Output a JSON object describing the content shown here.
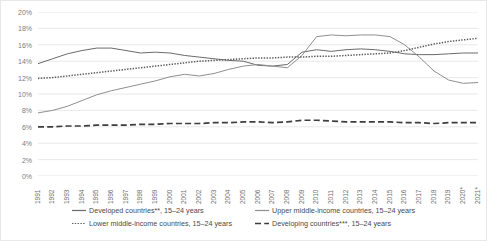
{
  "chart_data": {
    "type": "line",
    "title": "",
    "xlabel": "",
    "ylabel": "",
    "ylim": [
      0,
      20
    ],
    "ytick_step": 2,
    "ytick_labels": [
      "0%",
      "2%",
      "4%",
      "6%",
      "8%",
      "10%",
      "12%",
      "14%",
      "16%",
      "18%",
      "20%"
    ],
    "grid": true,
    "grid_axis": "y",
    "legend_position": "bottom",
    "x": [
      "1991",
      "1992",
      "1993",
      "1994",
      "1995",
      "1996",
      "1997",
      "1998",
      "1999",
      "2000",
      "2001",
      "2002",
      "2003",
      "2004",
      "2005",
      "2006",
      "2007",
      "2008",
      "2009",
      "2010",
      "2011",
      "2012",
      "2013",
      "2014",
      "2015",
      "2016",
      "2017",
      "2018",
      "2019",
      "2020*",
      "2021*"
    ],
    "series": [
      {
        "name": "Developed countries**, 15–24 years",
        "style": "solid",
        "color": "#6b6b6b",
        "values": [
          13.7,
          14.3,
          14.9,
          15.3,
          15.6,
          15.6,
          15.3,
          15.0,
          15.1,
          15.0,
          14.7,
          14.5,
          14.3,
          14.1,
          14.0,
          13.5,
          13.4,
          13.6,
          15.1,
          15.4,
          15.2,
          15.4,
          15.5,
          15.4,
          15.2,
          14.9,
          14.8,
          14.8,
          14.9,
          15.0,
          15.0
        ]
      },
      {
        "name": "Upper middle-income countries, 15–24 years",
        "style": "solid",
        "color": "#8f8f8f",
        "values": [
          7.7,
          8.0,
          8.5,
          9.2,
          9.9,
          10.4,
          10.8,
          11.2,
          11.6,
          12.1,
          12.4,
          12.2,
          12.5,
          13.0,
          13.4,
          13.6,
          13.4,
          13.2,
          14.7,
          17.0,
          17.2,
          17.1,
          17.2,
          17.2,
          17.0,
          16.0,
          14.5,
          12.8,
          11.7,
          11.3,
          11.4
        ]
      },
      {
        "name": "Lower middle-income countries, 15–24 years",
        "style": "dotted",
        "color": "#5a5a5a",
        "values": [
          11.9,
          12.0,
          12.2,
          12.4,
          12.6,
          12.8,
          13.0,
          13.2,
          13.4,
          13.6,
          13.8,
          14.0,
          14.1,
          14.2,
          14.3,
          14.4,
          14.4,
          14.5,
          14.5,
          14.6,
          14.6,
          14.7,
          14.8,
          14.9,
          15.0,
          15.3,
          15.7,
          16.1,
          16.4,
          16.6,
          16.8
        ]
      },
      {
        "name": "Developing countries***, 15–24 years",
        "style": "dashed",
        "color": "#3d3d3d",
        "values": [
          6.0,
          6.0,
          6.1,
          6.1,
          6.2,
          6.2,
          6.2,
          6.3,
          6.3,
          6.4,
          6.4,
          6.4,
          6.5,
          6.5,
          6.6,
          6.6,
          6.5,
          6.6,
          6.8,
          6.8,
          6.7,
          6.6,
          6.6,
          6.6,
          6.6,
          6.5,
          6.5,
          6.4,
          6.5,
          6.5,
          6.5
        ]
      }
    ]
  },
  "legend": {
    "items": [
      {
        "label": "Developed countries**, 15–24 years"
      },
      {
        "label": "Upper middle-income countries, 15–24 years"
      },
      {
        "label": "Lower middle-income countries, 15–24 years"
      },
      {
        "label": "Developing countries***, 15–24 years"
      }
    ]
  },
  "colors": {
    "grid": "#e2e2e2",
    "axis_text": "#7c7c7c",
    "background": "#ffffff"
  }
}
